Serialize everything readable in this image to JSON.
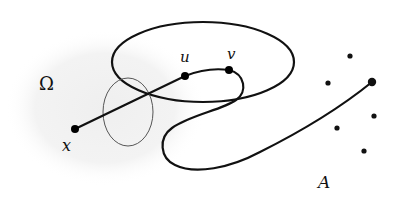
{
  "diagram": {
    "labels": {
      "omega": "Ω",
      "x": "x",
      "u": "u",
      "v": "v",
      "A": "A"
    },
    "colors": {
      "stroke": "#111111",
      "thin_stroke": "#555555",
      "region_fill": "#f2f2f2",
      "background": "#ffffff"
    },
    "elements": {
      "region_omega": "shaded domain Ω",
      "big_ellipse": "large closed curve",
      "small_ellipse": "thin small closed curve",
      "path": "curve from x through u and v to a point of A",
      "set_A": "discrete point set A"
    }
  }
}
